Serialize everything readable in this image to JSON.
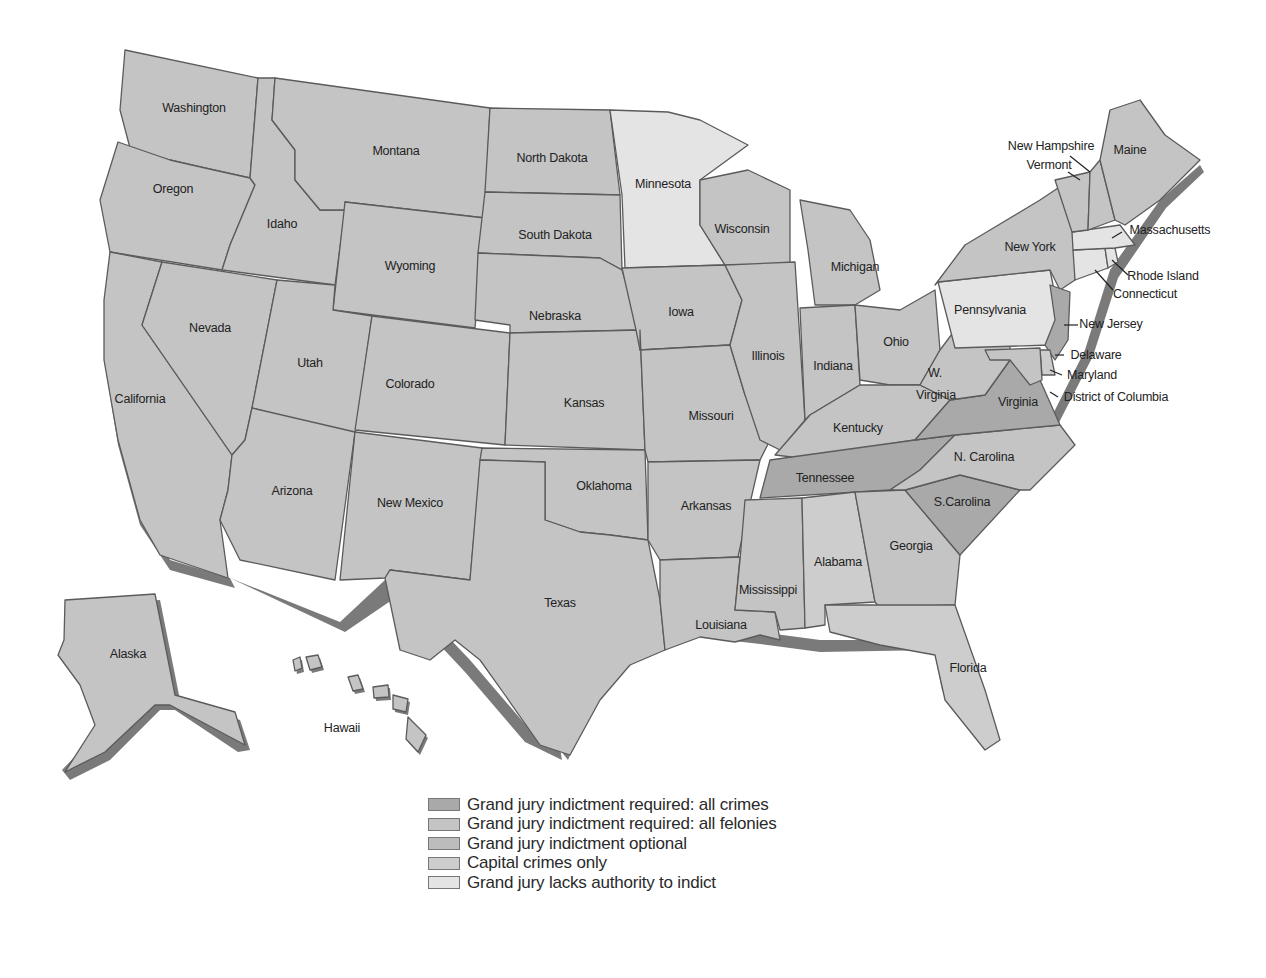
{
  "map": {
    "title": "",
    "colors": {
      "all_crimes": "#a9a9a9",
      "all_felonies": "#c6c6c6",
      "optional": "#bdbdbd",
      "capital_only": "#cfcfcf",
      "no_authority": "#e6e6e6",
      "shadow": "#7a7a7a",
      "border": "#5b5b5b"
    },
    "states": {
      "washington": "Washington",
      "oregon": "Oregon",
      "california": "California",
      "idaho": "Idaho",
      "nevada": "Nevada",
      "montana": "Montana",
      "wyoming": "Wyoming",
      "utah": "Utah",
      "arizona": "Arizona",
      "colorado": "Colorado",
      "new_mexico": "New Mexico",
      "north_dakota": "North Dakota",
      "south_dakota": "South Dakota",
      "nebraska": "Nebraska",
      "kansas": "Kansas",
      "oklahoma": "Oklahoma",
      "texas": "Texas",
      "minnesota": "Minnesota",
      "iowa": "Iowa",
      "missouri": "Missouri",
      "arkansas": "Arkansas",
      "louisiana": "Louisiana",
      "wisconsin": "Wisconsin",
      "illinois": "Illinois",
      "michigan": "Michigan",
      "indiana": "Indiana",
      "ohio": "Ohio",
      "kentucky": "Kentucky",
      "tennessee": "Tennessee",
      "mississippi": "Mississippi",
      "alabama": "Alabama",
      "georgia": "Georgia",
      "florida": "Florida",
      "south_carolina": "S.Carolina",
      "north_carolina": "N. Carolina",
      "virginia": "Virginia",
      "west_virginia_1": "W.",
      "west_virginia_2": "Virginia",
      "pennsylvania": "Pennsylvania",
      "new_york": "New York",
      "new_jersey": "New Jersey",
      "delaware": "Delaware",
      "maryland": "Maryland",
      "dc": "District of Columbia",
      "connecticut": "Connecticut",
      "rhode_island": "Rhode Island",
      "massachusetts": "Massachusetts",
      "vermont": "Vermont",
      "new_hampshire": "New Hampshire",
      "maine": "Maine",
      "alaska": "Alaska",
      "hawaii": "Hawaii"
    }
  },
  "legend": {
    "items": [
      {
        "label": "Grand jury indictment required: all crimes",
        "color": "#a9a9a9"
      },
      {
        "label": "Grand jury indictment required: all felonies",
        "color": "#c4c4c4"
      },
      {
        "label": "Grand jury indictment optional",
        "color": "#bcbcbc"
      },
      {
        "label": "Capital crimes only",
        "color": "#cdcdcd"
      },
      {
        "label": "Grand jury lacks authority to indict",
        "color": "#e4e4e4"
      }
    ]
  }
}
